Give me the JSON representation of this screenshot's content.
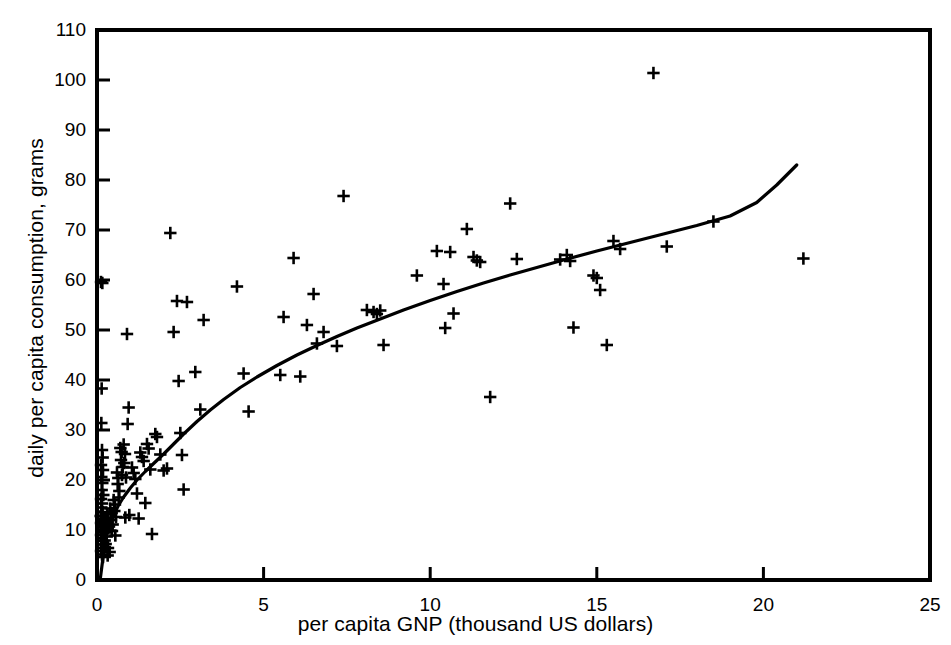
{
  "chart_data": {
    "type": "scatter",
    "title": "",
    "xlabel": "per capita GNP (thousand US dollars)",
    "ylabel": "daily per capita consumption, grams",
    "xlim": [
      0,
      25
    ],
    "ylim": [
      0,
      110
    ],
    "xticks": [
      0,
      5,
      10,
      15,
      20,
      25
    ],
    "yticks": [
      0,
      10,
      20,
      30,
      40,
      50,
      60,
      70,
      80,
      90,
      100,
      110
    ],
    "grid": false,
    "legend": null,
    "marker": "plus",
    "marker_color": "#000000",
    "line_color": "#000000",
    "series": [
      {
        "name": "countries",
        "type": "scatter",
        "points": [
          [
            0.12,
            59.6
          ],
          [
            0.16,
            59.4
          ],
          [
            0.14,
            38.3
          ],
          [
            0.13,
            31.4
          ],
          [
            0.15,
            26.0
          ],
          [
            0.17,
            24.5
          ],
          [
            0.12,
            23.0
          ],
          [
            0.18,
            22.0
          ],
          [
            0.13,
            20.6
          ],
          [
            0.16,
            19.4
          ],
          [
            0.14,
            18.0
          ],
          [
            0.19,
            17.0
          ],
          [
            0.12,
            16.2
          ],
          [
            0.15,
            15.3
          ],
          [
            0.13,
            14.5
          ],
          [
            0.17,
            13.6
          ],
          [
            0.11,
            12.8
          ],
          [
            0.14,
            12.2
          ],
          [
            0.18,
            11.8
          ],
          [
            0.12,
            11.4
          ],
          [
            0.16,
            11.0
          ],
          [
            0.13,
            10.6
          ],
          [
            0.15,
            10.1
          ],
          [
            0.19,
            9.6
          ],
          [
            0.12,
            9.0
          ],
          [
            0.14,
            8.4
          ],
          [
            0.17,
            7.8
          ],
          [
            0.13,
            7.1
          ],
          [
            0.16,
            6.4
          ],
          [
            0.12,
            5.8
          ],
          [
            0.15,
            5.1
          ],
          [
            0.18,
            4.6
          ],
          [
            0.22,
            12.1
          ],
          [
            0.25,
            11.6
          ],
          [
            0.21,
            10.9
          ],
          [
            0.27,
            10.2
          ],
          [
            0.24,
            9.5
          ],
          [
            0.29,
            8.7
          ],
          [
            0.23,
            7.9
          ],
          [
            0.26,
            7.2
          ],
          [
            0.31,
            13.2
          ],
          [
            0.34,
            12.4
          ],
          [
            0.3,
            11.5
          ],
          [
            0.36,
            10.7
          ],
          [
            0.33,
            6.4
          ],
          [
            0.38,
            5.6
          ],
          [
            0.32,
            4.9
          ],
          [
            0.4,
            14.3
          ],
          [
            0.44,
            13.4
          ],
          [
            0.42,
            12.0
          ],
          [
            0.47,
            11.1
          ],
          [
            0.45,
            9.8
          ],
          [
            0.5,
            16.0
          ],
          [
            0.54,
            15.1
          ],
          [
            0.52,
            13.8
          ],
          [
            0.57,
            12.6
          ],
          [
            0.55,
            8.9
          ],
          [
            0.6,
            21.5
          ],
          [
            0.64,
            20.4
          ],
          [
            0.62,
            19.2
          ],
          [
            0.67,
            17.8
          ],
          [
            0.65,
            16.5
          ],
          [
            0.7,
            26.4
          ],
          [
            0.74,
            25.6
          ],
          [
            0.72,
            24.0
          ],
          [
            0.77,
            22.6
          ],
          [
            0.75,
            21.0
          ],
          [
            0.8,
            27.1
          ],
          [
            0.84,
            25.2
          ],
          [
            0.82,
            23.4
          ],
          [
            0.87,
            20.5
          ],
          [
            0.85,
            12.5
          ],
          [
            0.9,
            49.2
          ],
          [
            0.95,
            34.5
          ],
          [
            0.92,
            31.2
          ],
          [
            0.97,
            13.0
          ],
          [
            1.05,
            22.5
          ],
          [
            1.1,
            21.4
          ],
          [
            1.15,
            20.2
          ],
          [
            1.2,
            17.3
          ],
          [
            1.25,
            12.3
          ],
          [
            1.3,
            25.5
          ],
          [
            1.35,
            24.6
          ],
          [
            1.4,
            23.8
          ],
          [
            1.45,
            15.4
          ],
          [
            1.5,
            27.2
          ],
          [
            1.55,
            26.3
          ],
          [
            1.6,
            22.1
          ],
          [
            1.65,
            9.2
          ],
          [
            1.75,
            29.2
          ],
          [
            1.8,
            28.6
          ],
          [
            1.9,
            25.1
          ],
          [
            2.0,
            21.9
          ],
          [
            2.1,
            22.3
          ],
          [
            2.2,
            69.4
          ],
          [
            2.3,
            49.6
          ],
          [
            2.4,
            55.8
          ],
          [
            2.45,
            39.8
          ],
          [
            2.5,
            29.4
          ],
          [
            2.55,
            25.0
          ],
          [
            2.6,
            18.1
          ],
          [
            2.7,
            55.6
          ],
          [
            2.95,
            41.6
          ],
          [
            3.1,
            34.1
          ],
          [
            3.2,
            52.0
          ],
          [
            4.2,
            58.7
          ],
          [
            4.4,
            41.3
          ],
          [
            4.55,
            33.7
          ],
          [
            5.5,
            41.0
          ],
          [
            5.6,
            52.6
          ],
          [
            5.9,
            64.4
          ],
          [
            6.1,
            40.7
          ],
          [
            6.3,
            51.0
          ],
          [
            6.5,
            57.2
          ],
          [
            6.6,
            47.3
          ],
          [
            6.8,
            49.6
          ],
          [
            7.2,
            46.8
          ],
          [
            7.4,
            76.8
          ],
          [
            8.1,
            54.0
          ],
          [
            8.3,
            53.6
          ],
          [
            8.4,
            53.2
          ],
          [
            8.5,
            53.9
          ],
          [
            8.6,
            47.0
          ],
          [
            9.6,
            60.9
          ],
          [
            10.2,
            65.8
          ],
          [
            10.4,
            59.2
          ],
          [
            10.45,
            50.4
          ],
          [
            10.6,
            65.6
          ],
          [
            10.7,
            53.3
          ],
          [
            11.1,
            70.2
          ],
          [
            11.3,
            64.6
          ],
          [
            11.4,
            63.9
          ],
          [
            11.5,
            63.6
          ],
          [
            11.8,
            36.6
          ],
          [
            12.4,
            75.3
          ],
          [
            12.6,
            64.2
          ],
          [
            13.9,
            64.1
          ],
          [
            14.1,
            65.0
          ],
          [
            14.2,
            63.8
          ],
          [
            14.3,
            50.5
          ],
          [
            14.9,
            60.9
          ],
          [
            15.0,
            60.4
          ],
          [
            15.1,
            58.0
          ],
          [
            15.3,
            47.0
          ],
          [
            15.5,
            67.8
          ],
          [
            15.7,
            66.2
          ],
          [
            16.7,
            101.4
          ],
          [
            17.1,
            66.7
          ],
          [
            18.5,
            71.7
          ],
          [
            21.2,
            64.3
          ]
        ]
      },
      {
        "name": "fitted-curve",
        "type": "line",
        "points": [
          [
            0.1,
            0.3
          ],
          [
            0.2,
            5.5
          ],
          [
            0.3,
            9.0
          ],
          [
            0.4,
            11.3
          ],
          [
            0.5,
            13.0
          ],
          [
            0.65,
            15.0
          ],
          [
            0.8,
            16.6
          ],
          [
            1.0,
            18.4
          ],
          [
            1.2,
            20.0
          ],
          [
            1.45,
            21.7
          ],
          [
            1.7,
            23.3
          ],
          [
            2.0,
            25.2
          ],
          [
            2.3,
            27.2
          ],
          [
            2.6,
            29.2
          ],
          [
            3.0,
            31.7
          ],
          [
            3.4,
            34.0
          ],
          [
            3.8,
            36.1
          ],
          [
            4.3,
            38.5
          ],
          [
            4.8,
            40.6
          ],
          [
            5.4,
            42.9
          ],
          [
            6.0,
            45.0
          ],
          [
            6.6,
            46.9
          ],
          [
            7.2,
            48.7
          ],
          [
            7.8,
            50.4
          ],
          [
            8.5,
            52.2
          ],
          [
            9.2,
            54.0
          ],
          [
            10.0,
            55.9
          ],
          [
            10.8,
            57.7
          ],
          [
            11.6,
            59.4
          ],
          [
            12.4,
            61.0
          ],
          [
            13.2,
            62.5
          ],
          [
            14.0,
            64.0
          ],
          [
            15.0,
            65.8
          ],
          [
            16.0,
            67.5
          ],
          [
            17.0,
            69.2
          ],
          [
            18.0,
            70.9
          ],
          [
            19.0,
            72.8
          ],
          [
            19.8,
            75.5
          ],
          [
            20.4,
            79.0
          ],
          [
            21.0,
            83.0
          ]
        ]
      }
    ]
  },
  "axes": {
    "x_title": "per capita GNP (thousand US dollars)",
    "y_title": "daily per capita consumption, grams",
    "x_tick_labels": [
      "0",
      "5",
      "10",
      "15",
      "20",
      "25"
    ],
    "y_tick_labels": [
      "0",
      "10",
      "20",
      "30",
      "40",
      "50",
      "60",
      "70",
      "80",
      "90",
      "100",
      "110"
    ]
  }
}
